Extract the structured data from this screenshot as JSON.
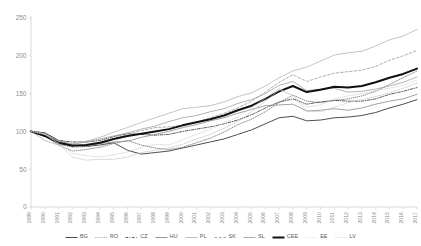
{
  "chart_data": {
    "type": "line",
    "title": "",
    "xlabel": "",
    "ylabel": "",
    "ylim": [
      0,
      250
    ],
    "yticks": [
      0,
      50,
      100,
      150,
      200,
      250
    ],
    "grid": false,
    "legend_position": "bottom",
    "x": [
      1989,
      1990,
      1991,
      1992,
      1993,
      1994,
      1995,
      1996,
      1997,
      1998,
      1999,
      2000,
      2001,
      2002,
      2003,
      2004,
      2005,
      2006,
      2007,
      2008,
      2009,
      2010,
      2011,
      2012,
      2013,
      2014,
      2015,
      2016,
      2017
    ],
    "xtick_labels": [
      "1989",
      "1990",
      "1991",
      "1992",
      "1993",
      "1994",
      "1995",
      "1996",
      "1997",
      "1998",
      "1999",
      "2000",
      "2001",
      "2002",
      "2003",
      "2004",
      "2005",
      "2006",
      "2007",
      "2008",
      "2009",
      "2010",
      "2011",
      "2012",
      "2013",
      "2014",
      "2015",
      "2016",
      "2017"
    ],
    "series": [
      {
        "name": "BG",
        "style": "solid",
        "color": "#3a3a3a",
        "width": 0.9,
        "values": [
          100,
          98,
          88,
          82,
          80,
          82,
          85,
          75,
          70,
          72,
          74,
          78,
          82,
          86,
          90,
          96,
          102,
          110,
          118,
          120,
          114,
          115,
          118,
          119,
          121,
          125,
          131,
          136,
          142
        ]
      },
      {
        "name": "RO",
        "style": "dotted",
        "color": "#6e6e6e",
        "width": 0.8,
        "values": [
          100,
          94,
          82,
          74,
          76,
          79,
          84,
          88,
          82,
          78,
          76,
          79,
          85,
          91,
          99,
          109,
          116,
          126,
          138,
          148,
          140,
          138,
          141,
          143,
          147,
          153,
          162,
          171,
          180
        ]
      },
      {
        "name": "CZ",
        "style": "dashdot",
        "color": "#4a4a4a",
        "width": 0.9,
        "values": [
          100,
          98,
          88,
          86,
          86,
          88,
          93,
          97,
          96,
          95,
          96,
          100,
          103,
          106,
          110,
          115,
          122,
          131,
          139,
          143,
          136,
          139,
          141,
          140,
          140,
          143,
          149,
          153,
          158
        ]
      },
      {
        "name": "HU",
        "style": "solid",
        "color": "#8a8a8a",
        "width": 0.8,
        "values": [
          100,
          96,
          85,
          82,
          81,
          84,
          86,
          87,
          92,
          96,
          100,
          105,
          109,
          114,
          118,
          124,
          129,
          134,
          135,
          136,
          127,
          128,
          130,
          128,
          131,
          136,
          140,
          143,
          149
        ]
      },
      {
        "name": "PL",
        "style": "solid",
        "color": "#b5b5b5",
        "width": 0.8,
        "values": [
          100,
          88,
          82,
          84,
          87,
          92,
          99,
          105,
          112,
          118,
          124,
          130,
          132,
          134,
          139,
          146,
          151,
          160,
          171,
          180,
          185,
          193,
          201,
          204,
          206,
          213,
          221,
          226,
          235
        ]
      },
      {
        "name": "SK",
        "style": "dashed",
        "color": "#9a9a9a",
        "width": 0.8,
        "values": [
          100,
          97,
          83,
          79,
          80,
          84,
          90,
          96,
          101,
          105,
          106,
          108,
          112,
          118,
          124,
          131,
          140,
          152,
          165,
          175,
          166,
          172,
          177,
          179,
          181,
          186,
          194,
          200,
          207
        ]
      },
      {
        "name": "SL",
        "style": "solid",
        "color": "#a0a0a0",
        "width": 0.8,
        "values": [
          100,
          95,
          88,
          83,
          86,
          90,
          94,
          98,
          103,
          107,
          113,
          118,
          121,
          126,
          130,
          137,
          142,
          150,
          161,
          166,
          154,
          156,
          157,
          152,
          153,
          156,
          160,
          165,
          172
        ]
      },
      {
        "name": "CEE",
        "style": "solid",
        "color": "#111111",
        "width": 2.0,
        "values": [
          100,
          94,
          85,
          81,
          82,
          85,
          90,
          94,
          97,
          100,
          103,
          108,
          112,
          116,
          121,
          128,
          134,
          143,
          153,
          160,
          152,
          155,
          159,
          158,
          160,
          165,
          171,
          176,
          183
        ]
      },
      {
        "name": "EE",
        "style": "dotted",
        "color": "#cfcfcf",
        "width": 0.8,
        "values": [
          100,
          96,
          84,
          71,
          68,
          66,
          69,
          73,
          79,
          83,
          82,
          89,
          96,
          103,
          111,
          119,
          131,
          144,
          157,
          147,
          132,
          135,
          143,
          147,
          150,
          154,
          157,
          161,
          168
        ]
      },
      {
        "name": "LV",
        "style": "dotted",
        "color": "#c0c0c0",
        "width": 0.8,
        "values": [
          100,
          97,
          84,
          66,
          62,
          63,
          63,
          66,
          72,
          75,
          78,
          83,
          90,
          96,
          104,
          113,
          126,
          140,
          155,
          148,
          127,
          126,
          132,
          138,
          142,
          146,
          151,
          157,
          164
        ]
      }
    ]
  },
  "legend": {
    "items": [
      {
        "label": "BG"
      },
      {
        "label": "RO"
      },
      {
        "label": "CZ"
      },
      {
        "label": "HU"
      },
      {
        "label": "PL"
      },
      {
        "label": "SK"
      },
      {
        "label": "SL"
      },
      {
        "label": "CEE"
      },
      {
        "label": "EE"
      },
      {
        "label": "LV"
      }
    ]
  }
}
